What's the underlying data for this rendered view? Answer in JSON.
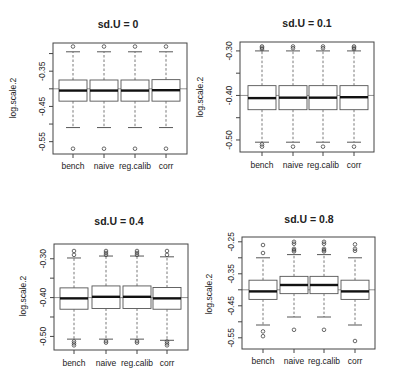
{
  "chart_data": [
    {
      "type": "boxplot",
      "title": "sd.U =  0",
      "xlabel": "",
      "ylabel": "log.scale.2",
      "categories": [
        "bench",
        "naive",
        "reg.calib",
        "corr"
      ],
      "yticks": [
        -0.3,
        -0.35,
        -0.4,
        -0.45,
        -0.5,
        -0.55
      ],
      "ytick_labels": [
        "",
        "-0.35",
        "",
        "-0.45",
        "",
        "-0.55"
      ],
      "ylim": [
        -0.585,
        -0.27
      ],
      "reference_line": -0.4,
      "boxes": [
        {
          "category": "bench",
          "whisker_low": -0.51,
          "q1": -0.435,
          "median": -0.405,
          "q3": -0.375,
          "whisker_high": -0.295,
          "outliers": [
            -0.28,
            -0.57
          ]
        },
        {
          "category": "naive",
          "whisker_low": -0.51,
          "q1": -0.435,
          "median": -0.405,
          "q3": -0.375,
          "whisker_high": -0.295,
          "outliers": [
            -0.28,
            -0.57
          ]
        },
        {
          "category": "reg.calib",
          "whisker_low": -0.51,
          "q1": -0.435,
          "median": -0.405,
          "q3": -0.375,
          "whisker_high": -0.295,
          "outliers": [
            -0.28,
            -0.57
          ]
        },
        {
          "category": "corr",
          "whisker_low": -0.51,
          "q1": -0.435,
          "median": -0.404,
          "q3": -0.374,
          "whisker_high": -0.295,
          "outliers": [
            -0.28,
            -0.57
          ]
        }
      ]
    },
    {
      "type": "boxplot",
      "title": "sd.U =  0.1",
      "xlabel": "",
      "ylabel": "log.scale.2",
      "categories": [
        "bench",
        "naive",
        "reg.calib",
        "corr"
      ],
      "yticks": [
        -0.3,
        -0.35,
        -0.4,
        -0.45,
        -0.5
      ],
      "ytick_labels": [
        "-0.30",
        "",
        "-0.40",
        "",
        "-0.50"
      ],
      "ylim": [
        -0.527,
        -0.28
      ],
      "reference_line": -0.4,
      "boxes": [
        {
          "category": "bench",
          "whisker_low": -0.505,
          "q1": -0.432,
          "median": -0.406,
          "q3": -0.378,
          "whisker_high": -0.3,
          "outliers": [
            -0.29,
            -0.293,
            -0.296,
            -0.51,
            -0.515
          ]
        },
        {
          "category": "naive",
          "whisker_low": -0.505,
          "q1": -0.432,
          "median": -0.405,
          "q3": -0.378,
          "whisker_high": -0.3,
          "outliers": [
            -0.29,
            -0.294,
            -0.515
          ]
        },
        {
          "category": "reg.calib",
          "whisker_low": -0.505,
          "q1": -0.432,
          "median": -0.405,
          "q3": -0.378,
          "whisker_high": -0.3,
          "outliers": [
            -0.29,
            -0.294,
            -0.515
          ]
        },
        {
          "category": "corr",
          "whisker_low": -0.505,
          "q1": -0.432,
          "median": -0.404,
          "q3": -0.378,
          "whisker_high": -0.3,
          "outliers": [
            -0.29,
            -0.293,
            -0.296,
            -0.515
          ]
        }
      ]
    },
    {
      "type": "boxplot",
      "title": "sd.U =  0.4",
      "xlabel": "",
      "ylabel": "log.scale.2",
      "categories": [
        "bench",
        "naive",
        "reg.calib",
        "corr"
      ],
      "yticks": [
        -0.3,
        -0.35,
        -0.4,
        -0.45,
        -0.5
      ],
      "ytick_labels": [
        "-0.30",
        "",
        "-0.40",
        "",
        "-0.50"
      ],
      "ylim": [
        -0.535,
        -0.262
      ],
      "reference_line": -0.4,
      "boxes": [
        {
          "category": "bench",
          "whisker_low": -0.507,
          "q1": -0.43,
          "median": -0.402,
          "q3": -0.375,
          "whisker_high": -0.298,
          "outliers": [
            -0.28,
            -0.29,
            -0.513,
            -0.518,
            -0.523
          ]
        },
        {
          "category": "naive",
          "whisker_low": -0.507,
          "q1": -0.428,
          "median": -0.398,
          "q3": -0.37,
          "whisker_high": -0.293,
          "outliers": [
            -0.28,
            -0.285,
            -0.29,
            -0.512,
            -0.516
          ]
        },
        {
          "category": "reg.calib",
          "whisker_low": -0.507,
          "q1": -0.428,
          "median": -0.398,
          "q3": -0.37,
          "whisker_high": -0.293,
          "outliers": [
            -0.28,
            -0.285,
            -0.29,
            -0.512,
            -0.516
          ]
        },
        {
          "category": "corr",
          "whisker_low": -0.51,
          "q1": -0.43,
          "median": -0.402,
          "q3": -0.374,
          "whisker_high": -0.295,
          "outliers": [
            -0.28,
            -0.29,
            -0.513,
            -0.518,
            -0.523
          ]
        }
      ]
    },
    {
      "type": "boxplot",
      "title": "sd.U =  0.8",
      "xlabel": "",
      "ylabel": "log.scale.2",
      "categories": [
        "bench",
        "naive",
        "reg.calib",
        "corr"
      ],
      "yticks": [
        -0.25,
        -0.3,
        -0.35,
        -0.4,
        -0.45,
        -0.5,
        -0.55
      ],
      "ytick_labels": [
        "-0.25",
        "",
        "-0.35",
        "",
        "-0.45",
        "",
        "-0.55"
      ],
      "ylim": [
        -0.585,
        -0.235
      ],
      "reference_line": -0.4,
      "boxes": [
        {
          "category": "bench",
          "whisker_low": -0.51,
          "q1": -0.43,
          "median": -0.405,
          "q3": -0.37,
          "whisker_high": -0.3,
          "outliers": [
            -0.26,
            -0.285,
            -0.53,
            -0.545
          ]
        },
        {
          "category": "naive",
          "whisker_low": -0.485,
          "q1": -0.412,
          "median": -0.385,
          "q3": -0.358,
          "whisker_high": -0.29,
          "outliers": [
            -0.25,
            -0.256,
            -0.272,
            -0.276,
            -0.28,
            -0.525
          ]
        },
        {
          "category": "reg.calib",
          "whisker_low": -0.485,
          "q1": -0.412,
          "median": -0.385,
          "q3": -0.358,
          "whisker_high": -0.29,
          "outliers": [
            -0.25,
            -0.256,
            -0.272,
            -0.276,
            -0.28,
            -0.525
          ]
        },
        {
          "category": "corr",
          "whisker_low": -0.51,
          "q1": -0.43,
          "median": -0.405,
          "q3": -0.37,
          "whisker_high": -0.3,
          "outliers": [
            -0.258,
            -0.272,
            -0.278,
            -0.56
          ]
        }
      ]
    }
  ]
}
